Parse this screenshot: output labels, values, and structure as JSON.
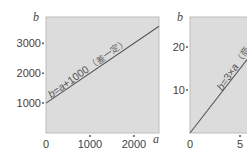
{
  "chart_data": [
    {
      "type": "line",
      "title": "",
      "xlabel": "a",
      "ylabel": "b",
      "xlim": [
        0,
        2570
      ],
      "ylim": [
        0,
        3880
      ],
      "x_ticks": [
        0,
        1000,
        2000
      ],
      "x_tick_labels": [
        "0",
        "1000",
        "2000"
      ],
      "y_ticks": [
        1000,
        2000,
        3000
      ],
      "y_tick_labels": [
        "1000",
        "2000",
        "3000"
      ],
      "grid": false,
      "series": [
        {
          "name": "b=a+1000",
          "equation": "b=a+1000",
          "x": [
            0,
            2570
          ],
          "y": [
            1000,
            3570
          ]
        }
      ],
      "annotation": {
        "formula_parts": [
          "b",
          "=",
          "a",
          "+1000"
        ],
        "note": "（差一定）"
      },
      "colors": {
        "background": "#dcdcdc",
        "border": "#bdbdbd",
        "line": "#555555",
        "text": "#444444"
      }
    },
    {
      "type": "line",
      "title": "",
      "xlabel": "a",
      "ylabel": "b",
      "xlim": [
        0,
        6.5
      ],
      "ylim": [
        0,
        27
      ],
      "x_ticks": [
        0,
        5
      ],
      "x_tick_labels": [
        "0",
        "5"
      ],
      "y_ticks": [
        10,
        20
      ],
      "y_tick_labels": [
        "10",
        "20"
      ],
      "grid": false,
      "series": [
        {
          "name": "b=3×a",
          "equation": "b=3×a",
          "x": [
            0,
            6.5
          ],
          "y": [
            0,
            19.5
          ]
        }
      ],
      "annotation": {
        "formula_parts": [
          "b",
          "=3×",
          "a",
          ""
        ],
        "note": "（商一定）"
      },
      "colors": {
        "background": "#dcdcdc",
        "border": "#bdbdbd",
        "line": "#555555",
        "text": "#444444"
      }
    }
  ]
}
